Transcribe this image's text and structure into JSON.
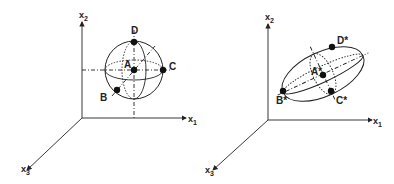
{
  "left": {
    "axes": {
      "x1": "x",
      "x1_sub": "1",
      "x2": "x",
      "x2_sub": "2",
      "x3": "x",
      "x3_sub": "3"
    },
    "points": {
      "A": "A",
      "B": "B",
      "C": "C",
      "D": "D"
    },
    "shape": "sphere"
  },
  "right": {
    "axes": {
      "x1": "x",
      "x1_sub": "1",
      "x2": "x",
      "x2_sub": "2",
      "x3": "x",
      "x3_sub": "3"
    },
    "points": {
      "A": "A*",
      "B": "B*",
      "C": "C*",
      "D": "D*"
    },
    "shape": "ellipsoid"
  },
  "colors": {
    "ink": "#222222"
  }
}
